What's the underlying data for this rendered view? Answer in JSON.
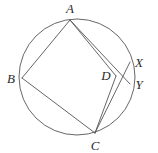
{
  "figure": {
    "kind": "geometry-diagram",
    "background_color": "#ffffff",
    "stroke_color": "#555555",
    "label_color": "#2b2b2b",
    "stroke_width": 0.9,
    "width": 158,
    "height": 153
  },
  "circle": {
    "name": "circumcircle",
    "cx": 77,
    "cy": 77,
    "r": 58
  },
  "points": [
    {
      "id": "A",
      "label": "A",
      "x": 70,
      "y": 20,
      "label_x": 70,
      "label_y": 8,
      "on_circle": true
    },
    {
      "id": "B",
      "label": "B",
      "x": 22,
      "y": 78,
      "label_x": 11,
      "label_y": 78,
      "on_circle": true
    },
    {
      "id": "C",
      "label": "C",
      "x": 95,
      "y": 133,
      "label_x": 95,
      "label_y": 145,
      "on_circle": true
    },
    {
      "id": "D",
      "label": "D",
      "x": 116,
      "y": 76,
      "label_x": 106,
      "label_y": 75,
      "on_circle": false
    },
    {
      "id": "X",
      "label": "X",
      "x": 130,
      "y": 62,
      "label_x": 139,
      "label_y": 62,
      "on_circle": true
    },
    {
      "id": "Y",
      "label": "Y",
      "x": 130,
      "y": 84,
      "label_x": 139,
      "label_y": 84,
      "on_circle": true
    }
  ],
  "segments": [
    {
      "id": "AB",
      "name": "segment-ab",
      "from": "A",
      "to": "B"
    },
    {
      "id": "BC",
      "name": "segment-bc",
      "from": "B",
      "to": "C"
    },
    {
      "id": "CD",
      "name": "segment-cd",
      "from": "C",
      "to": "D"
    },
    {
      "id": "DA",
      "name": "segment-da",
      "from": "D",
      "to": "A"
    },
    {
      "id": "AY",
      "name": "segment-a-to-y",
      "from": "A",
      "to": "Y"
    },
    {
      "id": "CX",
      "name": "segment-c-to-x",
      "from": "C",
      "to": "X"
    }
  ],
  "quadrilateral": {
    "name": "quadrilateral-abcd",
    "vertices": [
      "A",
      "B",
      "C",
      "D"
    ]
  }
}
